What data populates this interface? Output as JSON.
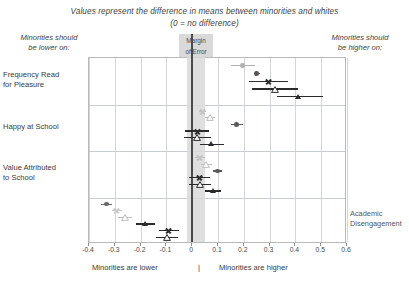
{
  "title": {
    "line1": "Values represent the difference in means between minorities and whites",
    "line2": "(0 = no difference)"
  },
  "corner_labels": {
    "left": "Minorities should\nbe lower on:",
    "right": "Minorities should\nbe higher on:"
  },
  "annotations": {
    "margin_of_error": "Margin\nof Error",
    "academic_disengagement": "Academic\nDisengagement"
  },
  "footer": {
    "left": "Minorities are lower",
    "separator": "|",
    "right": "Minorities are higher"
  },
  "chart_data": {
    "type": "scatter",
    "title": "Values represent the difference in means between minorities and whites (0 = no difference)",
    "xlabel": "Difference in means between minorities and whites",
    "ylabel": "",
    "xlim": [
      -0.4,
      0.6
    ],
    "xticks": [
      -0.4,
      -0.3,
      -0.2,
      -0.1,
      0,
      0.1,
      0.2,
      0.3,
      0.4,
      0.5,
      0.6
    ],
    "xtick_labels": [
      "-0.4",
      "-0.3",
      "-0.2",
      "-0.1",
      "0",
      "0.1",
      "0.2",
      "0.3",
      "0.4",
      "0.5",
      "0.6"
    ],
    "grid": true,
    "legend": "none",
    "reference_line": 0,
    "margin_of_error_band": [
      -0.02,
      0.05
    ],
    "categories": [
      "Frequency Read for Pleasure",
      "Happy at School",
      "Value Attributed to School",
      "Academic Disengagement"
    ],
    "series": [
      {
        "name": "series-1",
        "marker": "circle",
        "color": "#9a9a9a",
        "faded": true
      },
      {
        "name": "series-2",
        "marker": "x",
        "color": "#8f8f8f",
        "faded": true
      },
      {
        "name": "series-3",
        "marker": "triangle-open",
        "color": "#a6a6a6",
        "faded": true
      },
      {
        "name": "series-4",
        "marker": "triangle-fill",
        "color": "#9e9e9e",
        "faded": true
      },
      {
        "name": "series-5",
        "marker": "circle",
        "color": "#4a4a4a",
        "faded": false
      },
      {
        "name": "series-6",
        "marker": "x",
        "color": "#2b2b2b",
        "faded": false
      },
      {
        "name": "series-7",
        "marker": "triangle-open",
        "color": "#2b2b2b",
        "faded": false
      },
      {
        "name": "series-8",
        "marker": "triangle-fill",
        "color": "#2b2b2b",
        "faded": false
      }
    ],
    "points": [
      {
        "row": 0,
        "sub": 0,
        "series": "series-1",
        "x": 0.195,
        "lo": 0.15,
        "hi": 0.245,
        "marker": "circle",
        "color": "#b0b0b0"
      },
      {
        "row": 0,
        "sub": 1,
        "series": "series-5",
        "x": 0.25,
        "lo": 0.24,
        "hi": 0.262,
        "marker": "circle",
        "color": "#555555"
      },
      {
        "row": 0,
        "sub": 2,
        "series": "series-6",
        "x": 0.296,
        "lo": 0.22,
        "hi": 0.37,
        "marker": "x",
        "color": "#2b2b2b"
      },
      {
        "row": 0,
        "sub": 3,
        "series": "series-7",
        "x": 0.32,
        "lo": 0.232,
        "hi": 0.412,
        "marker": "triangle-open",
        "color": "#2b2b2b"
      },
      {
        "row": 0,
        "sub": 4,
        "series": "series-8",
        "x": 0.41,
        "lo": 0.33,
        "hi": 0.508,
        "marker": "triangle-fill",
        "color": "#2b2b2b"
      },
      {
        "row": 1,
        "sub": 0,
        "series": "series-1",
        "x": 0.04,
        "lo": 0.028,
        "hi": 0.052,
        "marker": "x",
        "color": "#c0c0c0"
      },
      {
        "row": 1,
        "sub": 1,
        "series": "series-3",
        "x": 0.068,
        "lo": 0.05,
        "hi": 0.09,
        "marker": "triangle-open",
        "color": "#bdbdbd"
      },
      {
        "row": 1,
        "sub": 2,
        "series": "series-5",
        "x": 0.172,
        "lo": 0.152,
        "hi": 0.196,
        "marker": "circle",
        "color": "#5a5a5a"
      },
      {
        "row": 1,
        "sub": 3,
        "series": "series-6",
        "x": 0.02,
        "lo": -0.028,
        "hi": 0.066,
        "marker": "x",
        "color": "#2b2b2b"
      },
      {
        "row": 1,
        "sub": 4,
        "series": "series-7",
        "x": 0.02,
        "lo": -0.03,
        "hi": 0.072,
        "marker": "triangle-open",
        "color": "#2b2b2b"
      },
      {
        "row": 1,
        "sub": 5,
        "series": "series-8",
        "x": 0.075,
        "lo": 0.03,
        "hi": 0.122,
        "marker": "triangle-fill",
        "color": "#2b2b2b"
      },
      {
        "row": 2,
        "sub": 0,
        "series": "series-2",
        "x": 0.03,
        "lo": 0.012,
        "hi": 0.05,
        "marker": "x",
        "color": "#c4c4c4"
      },
      {
        "row": 2,
        "sub": 1,
        "series": "series-3",
        "x": 0.055,
        "lo": 0.036,
        "hi": 0.078,
        "marker": "triangle-open",
        "color": "#c0c0c0"
      },
      {
        "row": 2,
        "sub": 2,
        "series": "series-5",
        "x": 0.098,
        "lo": 0.082,
        "hi": 0.114,
        "marker": "circle",
        "color": "#5a5a5a"
      },
      {
        "row": 2,
        "sub": 3,
        "series": "series-6",
        "x": 0.028,
        "lo": -0.012,
        "hi": 0.068,
        "marker": "x",
        "color": "#2b2b2b"
      },
      {
        "row": 2,
        "sub": 4,
        "series": "series-7",
        "x": 0.03,
        "lo": -0.012,
        "hi": 0.072,
        "marker": "triangle-open",
        "color": "#2b2b2b"
      },
      {
        "row": 2,
        "sub": 5,
        "series": "series-8",
        "x": 0.08,
        "lo": 0.048,
        "hi": 0.112,
        "marker": "triangle-fill",
        "color": "#2b2b2b"
      },
      {
        "row": 3,
        "sub": 0,
        "series": "series-5",
        "x": -0.332,
        "lo": -0.352,
        "hi": -0.312,
        "marker": "circle",
        "color": "#6a6a6a"
      },
      {
        "row": 3,
        "sub": 1,
        "series": "series-2",
        "x": -0.292,
        "lo": -0.31,
        "hi": -0.272,
        "marker": "x",
        "color": "#c8c8c8"
      },
      {
        "row": 3,
        "sub": 2,
        "series": "series-3",
        "x": -0.262,
        "lo": -0.288,
        "hi": -0.232,
        "marker": "triangle-open",
        "color": "#bfbfbf"
      },
      {
        "row": 3,
        "sub": 3,
        "series": "series-8",
        "x": -0.182,
        "lo": -0.218,
        "hi": -0.146,
        "marker": "triangle-fill",
        "color": "#2b2b2b"
      },
      {
        "row": 3,
        "sub": 4,
        "series": "series-6",
        "x": -0.09,
        "lo": -0.128,
        "hi": -0.05,
        "marker": "x",
        "color": "#2b2b2b"
      },
      {
        "row": 3,
        "sub": 5,
        "series": "series-7",
        "x": -0.098,
        "lo": -0.14,
        "hi": -0.056,
        "marker": "triangle-open",
        "color": "#2b2b2b"
      }
    ],
    "row_labels": [
      {
        "text": "Frequency Read\nfor Pleasure",
        "row": 0
      },
      {
        "text": "Happy at School",
        "row": 1
      },
      {
        "text": "Value Attributed\nto School",
        "row": 2
      },
      {
        "text": "Academic\nDisengagement",
        "row": 3
      }
    ]
  }
}
